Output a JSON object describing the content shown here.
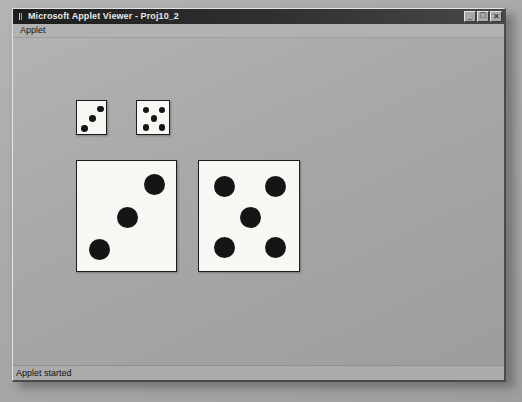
{
  "window": {
    "title": "Microsoft Applet Viewer - Proj10_2",
    "icon": "applet-viewer-icon",
    "controls": [
      {
        "name": "minimize-button",
        "glyph": "_"
      },
      {
        "name": "maximize-button",
        "glyph": "□"
      },
      {
        "name": "close-button",
        "glyph": "✕"
      }
    ]
  },
  "menubar": {
    "items": [
      {
        "label": "Applet"
      }
    ]
  },
  "statusbar": {
    "text": "Applet started"
  },
  "applet": {
    "background_color": "#a7a7a7",
    "die_face_color": "#f7f7f4",
    "pip_color": "#151515",
    "border_color": "#1c1c1c",
    "dice": [
      {
        "name": "small-die-left",
        "value": 3,
        "size": "small",
        "x": 76,
        "y": 100,
        "w": 31,
        "h": 35,
        "pip_radius": 3.4,
        "pips": [
          {
            "cx": 0.76,
            "cy": 0.23
          },
          {
            "cx": 0.5,
            "cy": 0.5
          },
          {
            "cx": 0.24,
            "cy": 0.78
          }
        ]
      },
      {
        "name": "small-die-right",
        "value": 5,
        "size": "small",
        "x": 136,
        "y": 100,
        "w": 34,
        "h": 35,
        "pip_radius": 3.2,
        "pips": [
          {
            "cx": 0.27,
            "cy": 0.25
          },
          {
            "cx": 0.73,
            "cy": 0.25
          },
          {
            "cx": 0.5,
            "cy": 0.5
          },
          {
            "cx": 0.27,
            "cy": 0.76
          },
          {
            "cx": 0.73,
            "cy": 0.76
          }
        ]
      },
      {
        "name": "large-die-left",
        "value": 3,
        "size": "large",
        "x": 76,
        "y": 160,
        "w": 101,
        "h": 112,
        "pip_radius": 10.5,
        "pips": [
          {
            "cx": 0.77,
            "cy": 0.21
          },
          {
            "cx": 0.5,
            "cy": 0.5
          },
          {
            "cx": 0.22,
            "cy": 0.79
          }
        ]
      },
      {
        "name": "large-die-right",
        "value": 5,
        "size": "large",
        "x": 198,
        "y": 160,
        "w": 102,
        "h": 112,
        "pip_radius": 10.5,
        "pips": [
          {
            "cx": 0.25,
            "cy": 0.23
          },
          {
            "cx": 0.75,
            "cy": 0.23
          },
          {
            "cx": 0.5,
            "cy": 0.5
          },
          {
            "cx": 0.25,
            "cy": 0.77
          },
          {
            "cx": 0.75,
            "cy": 0.77
          }
        ]
      }
    ]
  }
}
